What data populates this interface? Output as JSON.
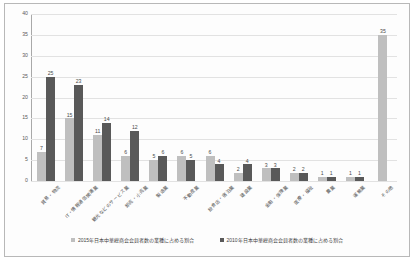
{
  "chart_data": {
    "type": "bar",
    "title": "",
    "xlabel": "",
    "ylabel": "",
    "ylim": [
      0,
      40
    ],
    "yticks": [
      0,
      5,
      10,
      15,
      20,
      25,
      30,
      35,
      40
    ],
    "grid": true,
    "legend_position": "bottom",
    "categories": [
      "貿易・物流",
      "IT・情報通信関連業",
      "観光などのサービス業",
      "卸売・小売業",
      "製造業",
      "不動産業",
      "飲食店・宿泊業",
      "建設業",
      "金融・保険業",
      "医療・福祉",
      "農業",
      "運輸業",
      "その他"
    ],
    "series": [
      {
        "name": "2015年日本中華総商会会員者数の業種に占める割合",
        "color": "#bfbfbf",
        "values": [
          7,
          15,
          11,
          6,
          5,
          6,
          6,
          2,
          3,
          2,
          1,
          1,
          35
        ]
      },
      {
        "name": "2010年日本中華総商会会員者数の業種に占める割合",
        "color": "#595959",
        "values": [
          25,
          23,
          14,
          12,
          6,
          5,
          4,
          4,
          3,
          2,
          1,
          1,
          null
        ]
      }
    ]
  }
}
